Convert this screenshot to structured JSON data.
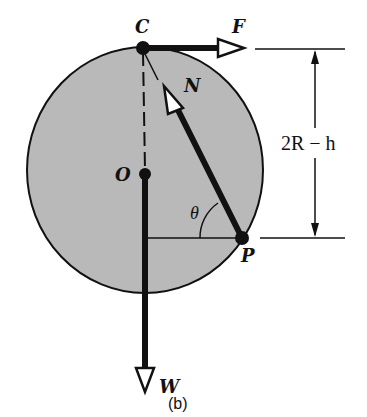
{
  "figure": {
    "caption": "(b)",
    "colors": {
      "disk_fill": "#b9b9b9",
      "stroke": "#111111",
      "background": "#ffffff"
    },
    "disk": {
      "cx": 145,
      "cy": 170,
      "rx": 118,
      "ry": 123
    },
    "points": {
      "C": {
        "label": "C",
        "x": 143,
        "y": 48
      },
      "O": {
        "label": "O",
        "x": 145,
        "y": 174
      },
      "P": {
        "label": "P",
        "x": 242,
        "y": 238
      }
    },
    "forces": {
      "F": {
        "label": "F",
        "direction": "right",
        "from": "C"
      },
      "N": {
        "label": "N",
        "direction": "from P toward C",
        "from": "P"
      },
      "W": {
        "label": "W",
        "direction": "down",
        "from": "O"
      }
    },
    "angle": {
      "label": "θ",
      "vertex": "P"
    },
    "dimension": {
      "label": "2R − h",
      "from_level": "C",
      "to_level": "P"
    }
  }
}
